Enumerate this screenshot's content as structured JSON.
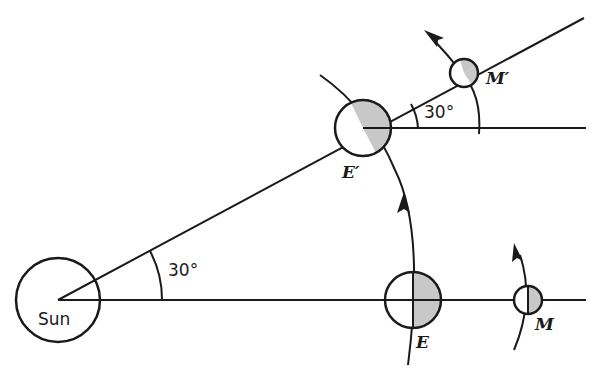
{
  "diagram": {
    "labels": {
      "sun": "Sun",
      "earth": "E",
      "moon": "M",
      "earth_prime": "E′",
      "moon_prime": "M′",
      "angle_at_sun": "30°",
      "angle_at_earth_prime": "30°"
    },
    "colors": {
      "stroke": "#1a1a1a",
      "shade": "#c8c8c8",
      "background": "#ffffff"
    }
  }
}
